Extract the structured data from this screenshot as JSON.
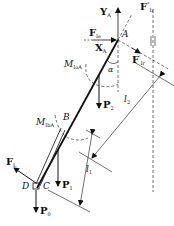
{
  "figure": {
    "type": "free-body diagram of inclined rod with forces and moments",
    "labels": {
      "YA": {
        "main": "Y",
        "sub": "A"
      },
      "FIe": {
        "main": "F",
        "sub": "Ie"
      },
      "XA": {
        "main": "X",
        "sub": "A"
      },
      "A": "A",
      "FIr2": {
        "main": "F",
        "sup": "\"",
        "sub": "Ir"
      },
      "FIr1": {
        "main": "F",
        "sup": "'",
        "sub": "Ir"
      },
      "MIoA": {
        "main": "M",
        "sub": "IoA"
      },
      "alpha": "α",
      "P2": {
        "main": "P",
        "sub": "2"
      },
      "l2": {
        "main": "l",
        "sub": "2"
      },
      "MIbA": {
        "main": "M",
        "sub": "IbA"
      },
      "B": "B",
      "l1": {
        "main": "l",
        "sub": "1"
      },
      "FL": {
        "main": "F",
        "sub": "L"
      },
      "D": "D",
      "C": "C",
      "P1": {
        "main": "P",
        "sub": "1"
      },
      "P0": {
        "main": "P",
        "sub": "0"
      }
    },
    "colors": {
      "ink": "#111111",
      "background": "#ffffff"
    }
  }
}
